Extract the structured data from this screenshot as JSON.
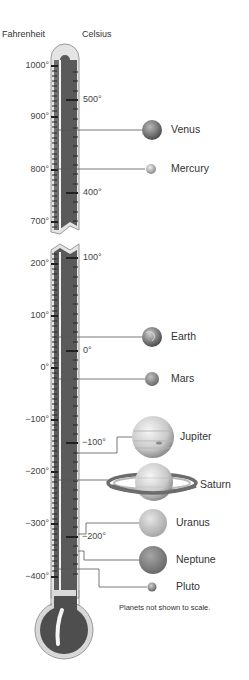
{
  "headers": {
    "fahrenheit": "Fahrenheit",
    "celsius": "Celsius"
  },
  "scales": {
    "upper": {
      "fahrenheit": [
        {
          "label": "1000°",
          "y": 66
        },
        {
          "label": "900°",
          "y": 117
        },
        {
          "label": "800°",
          "y": 170
        },
        {
          "label": "700°",
          "y": 222
        }
      ],
      "celsius": [
        {
          "label": "500°",
          "y": 100
        },
        {
          "label": "400°",
          "y": 193
        }
      ]
    },
    "lower": {
      "fahrenheit": [
        {
          "label": "200°",
          "y": 264
        },
        {
          "label": "100°",
          "y": 316
        },
        {
          "label": "0°",
          "y": 368
        },
        {
          "label": "−100°",
          "y": 420
        },
        {
          "label": "−200°",
          "y": 472
        },
        {
          "label": "−300°",
          "y": 524
        },
        {
          "label": "−400°",
          "y": 577
        }
      ],
      "celsius": [
        {
          "label": "100°",
          "y": 258
        },
        {
          "label": "0°",
          "y": 351
        },
        {
          "label": "−100°",
          "y": 443
        },
        {
          "label": "−200°",
          "y": 537
        }
      ]
    }
  },
  "planets": [
    {
      "name": "Venus",
      "label_y": 130
    },
    {
      "name": "Mercury",
      "label_y": 169
    },
    {
      "name": "Earth",
      "label_y": 337
    },
    {
      "name": "Mars",
      "label_y": 379
    },
    {
      "name": "Jupiter",
      "label_y": 437
    },
    {
      "name": "Saturn",
      "label_y": 485
    },
    {
      "name": "Uranus",
      "label_y": 523
    },
    {
      "name": "Neptune",
      "label_y": 560
    },
    {
      "name": "Pluto",
      "label_y": 587
    }
  ],
  "note": "Planets not shown to scale.",
  "colors": {
    "tube_outline": "#9a9a9a",
    "tube_glass": "#d9d9d9",
    "mercury_fill": "#5a5a5a",
    "text": "#333333"
  }
}
